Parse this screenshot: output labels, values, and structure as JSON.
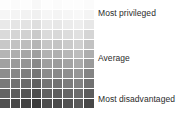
{
  "chart_data": {
    "type": "heatmap",
    "title": "",
    "xlabel": "",
    "ylabel": "",
    "grid": false,
    "legend_position": "right",
    "n_columns": 9,
    "n_rows": 11,
    "colormap": "greys",
    "value_range": [
      0,
      1
    ],
    "annotations": [
      {
        "id": "top",
        "text": "Most privileged",
        "row_index": 0
      },
      {
        "id": "middle",
        "text": "Average",
        "row_index": 5
      },
      {
        "id": "bottom",
        "text": "Most disadvantaged",
        "row_index": 10
      }
    ],
    "row_labels": [
      "",
      "",
      "",
      "",
      "",
      "",
      "",
      "",
      "",
      "",
      ""
    ],
    "column_labels": [
      "",
      "",
      "",
      "",
      "",
      "",
      "",
      "",
      ""
    ],
    "values": [
      [
        0.99,
        0.98,
        0.99,
        0.97,
        0.99,
        0.98,
        0.99,
        0.99,
        0.98
      ],
      [
        0.96,
        0.95,
        0.94,
        0.93,
        0.96,
        0.95,
        0.96,
        0.97,
        0.95
      ],
      [
        0.9,
        0.88,
        0.87,
        0.85,
        0.9,
        0.89,
        0.91,
        0.92,
        0.89
      ],
      [
        0.83,
        0.81,
        0.79,
        0.76,
        0.83,
        0.82,
        0.84,
        0.86,
        0.81
      ],
      [
        0.75,
        0.72,
        0.7,
        0.66,
        0.74,
        0.73,
        0.76,
        0.78,
        0.72
      ],
      [
        0.66,
        0.63,
        0.6,
        0.56,
        0.65,
        0.64,
        0.67,
        0.7,
        0.63
      ],
      [
        0.57,
        0.54,
        0.51,
        0.46,
        0.56,
        0.55,
        0.58,
        0.61,
        0.54
      ],
      [
        0.48,
        0.45,
        0.41,
        0.37,
        0.47,
        0.46,
        0.49,
        0.52,
        0.44
      ],
      [
        0.39,
        0.35,
        0.32,
        0.28,
        0.37,
        0.36,
        0.4,
        0.43,
        0.35
      ],
      [
        0.29,
        0.26,
        0.23,
        0.19,
        0.28,
        0.27,
        0.3,
        0.33,
        0.26
      ],
      [
        0.2,
        0.17,
        0.14,
        0.1,
        0.19,
        0.18,
        0.21,
        0.24,
        0.16
      ]
    ]
  },
  "labels": {
    "most_privileged": "Most privileged",
    "average": "Average",
    "most_disadvantaged": "Most disadvantaged"
  },
  "colors": {
    "background": "#ffffff",
    "text": "#2b2b2b",
    "cell_light": "#ffffff",
    "cell_dark": "#2e2e2e"
  }
}
